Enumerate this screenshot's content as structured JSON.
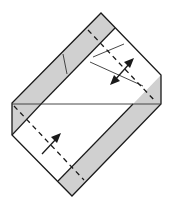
{
  "diagram": {
    "type": "origami-fold-step",
    "colors": {
      "paper_front": "#ffffff",
      "paper_back": "#d0d0d0",
      "outline": "#1a1a1a",
      "crease": "#333333"
    },
    "elements": {
      "top_strip": "gray colored band along upper-left edge",
      "bottom_strip": "gray colored band along lower-right edge",
      "valley_fold_upper": "dashed valley-fold line through upper-right area",
      "valley_fold_lower": "dashed valley-fold line through lower-left area",
      "double_arrow": "fold and unfold arrow",
      "single_arrow": "fold direction arrow"
    }
  }
}
